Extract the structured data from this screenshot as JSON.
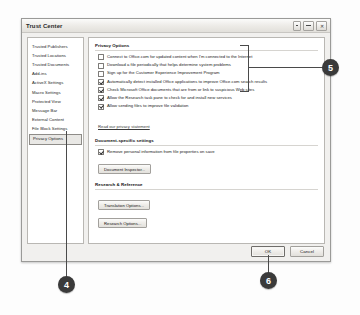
{
  "window": {
    "title": "Trust Center",
    "controls": [
      {
        "name": "minimize",
        "glyph": "–"
      },
      {
        "name": "restore",
        "glyph": "❐"
      },
      {
        "name": "close",
        "glyph": "✕"
      }
    ]
  },
  "sidebar": {
    "items": [
      {
        "label": "Trusted Publishers",
        "selected": false
      },
      {
        "label": "Trusted Locations",
        "selected": false
      },
      {
        "label": "Trusted Documents",
        "selected": false
      },
      {
        "label": "Add-ins",
        "selected": false
      },
      {
        "label": "ActiveX Settings",
        "selected": false
      },
      {
        "label": "Macro Settings",
        "selected": false
      },
      {
        "label": "Protected View",
        "selected": false
      },
      {
        "label": "Message Bar",
        "selected": false
      },
      {
        "label": "External Content",
        "selected": false
      },
      {
        "label": "File Block Settings",
        "selected": false
      },
      {
        "label": "Privacy Options",
        "selected": true
      }
    ]
  },
  "content": {
    "privacy": {
      "heading": "Privacy Options",
      "checkboxes": [
        {
          "label": "Connect to Office.com for updated content when I'm connected to the Internet",
          "checked": false
        },
        {
          "label": "Download a file periodically that helps determine system problems",
          "checked": false
        },
        {
          "label": "Sign up for the Customer Experience Improvement Program",
          "checked": false
        },
        {
          "label": "Automatically detect installed Office applications to improve Office.com search results",
          "checked": true
        },
        {
          "label": "Check Microsoft Office documents that are from or link to suspicious Web sites",
          "checked": true
        },
        {
          "label": "Allow the Research task pane to check for and install new services",
          "checked": true
        },
        {
          "label": "Allow sending files to improve file validation",
          "checked": true
        }
      ],
      "link": "Read our privacy statement"
    },
    "document_specific": {
      "heading": "Document-specific settings",
      "checkbox": {
        "label": "Remove personal information from file properties on save",
        "checked": true
      },
      "button": "Document Inspector..."
    },
    "research": {
      "heading": "Research & Reference",
      "buttons": [
        "Translation Options...",
        "Research Options..."
      ]
    }
  },
  "footer": {
    "ok": "OK",
    "cancel": "Cancel"
  },
  "callouts": [
    {
      "number": "4"
    },
    {
      "number": "5"
    },
    {
      "number": "6"
    }
  ]
}
